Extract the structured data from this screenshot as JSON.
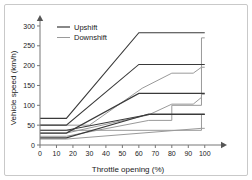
{
  "figure": {
    "border_color": "#c9c9c9",
    "background": "#ffffff"
  },
  "chart_data": {
    "type": "line",
    "title": "",
    "xlabel": "Throttle opening (%)",
    "ylabel": "Vehicle speed (km/h)",
    "xlim": [
      0,
      105
    ],
    "ylim": [
      0,
      310
    ],
    "xticks": [
      0,
      10,
      20,
      30,
      40,
      50,
      60,
      70,
      80,
      90,
      100
    ],
    "yticks": [
      0,
      50,
      100,
      150,
      200,
      250,
      300
    ],
    "xticklabels": [
      "0",
      "10",
      "20",
      "30",
      "40",
      "50",
      "60",
      "70",
      "80",
      "90",
      "100"
    ],
    "yticklabels": [
      "0",
      "50",
      "100",
      "150",
      "200",
      "250",
      "300"
    ],
    "grid": false,
    "legend_position": "upper-left",
    "legend": [
      {
        "name": "Upshift",
        "color": "#3a3a3a"
      },
      {
        "name": "Downshift",
        "color": "#9a9a9a"
      }
    ],
    "series": [
      {
        "name": "Upshift 4-5",
        "group": "Upshift",
        "color": "#3a3a3a",
        "x": [
          0,
          16,
          60,
          100
        ],
        "y": [
          67,
          67,
          283,
          283
        ]
      },
      {
        "name": "Upshift 3-4",
        "group": "Upshift",
        "color": "#3a3a3a",
        "x": [
          0,
          16,
          60,
          100
        ],
        "y": [
          50,
          50,
          203,
          203
        ]
      },
      {
        "name": "Upshift 2-3",
        "group": "Upshift",
        "color": "#3a3a3a",
        "x": [
          0,
          16,
          60,
          100
        ],
        "y": [
          30,
          30,
          130,
          130
        ]
      },
      {
        "name": "Upshift 1-2",
        "group": "Upshift",
        "color": "#3a3a3a",
        "x": [
          0,
          16,
          66,
          100
        ],
        "y": [
          18,
          18,
          78,
          78
        ]
      },
      {
        "name": "Upshift launch",
        "group": "Upshift",
        "color": "#3a3a3a",
        "x": [
          0,
          16,
          66,
          100
        ],
        "y": [
          37,
          37,
          77,
          77
        ]
      },
      {
        "name": "Downshift 5-4",
        "group": "Downshift",
        "color": "#9a9a9a",
        "x": [
          0,
          16,
          30,
          62,
          80,
          93,
          98,
          98,
          100
        ],
        "y": [
          50,
          50,
          50,
          143,
          181,
          181,
          196,
          270,
          270
        ]
      },
      {
        "name": "Downshift 4-3",
        "group": "Downshift",
        "color": "#9a9a9a",
        "x": [
          0,
          16,
          66,
          80,
          93,
          98,
          98,
          100
        ],
        "y": [
          30,
          30,
          76,
          103,
          103,
          120,
          196,
          196
        ]
      },
      {
        "name": "Downshift 3-2",
        "group": "Downshift",
        "color": "#9a9a9a",
        "x": [
          0,
          16,
          66,
          80,
          80,
          98,
          98,
          100
        ],
        "y": [
          22,
          22,
          62,
          62,
          100,
          100,
          128,
          128
        ]
      },
      {
        "name": "Downshift 2-1",
        "group": "Downshift",
        "color": "#9a9a9a",
        "x": [
          0,
          16,
          80,
          80,
          98,
          98,
          100
        ],
        "y": [
          37,
          37,
          37,
          37,
          37,
          77,
          77
        ]
      },
      {
        "name": "Downshift coast",
        "group": "Downshift",
        "color": "#9a9a9a",
        "x": [
          0,
          16,
          98,
          98,
          100
        ],
        "y": [
          15,
          15,
          42,
          42,
          42
        ]
      }
    ]
  }
}
